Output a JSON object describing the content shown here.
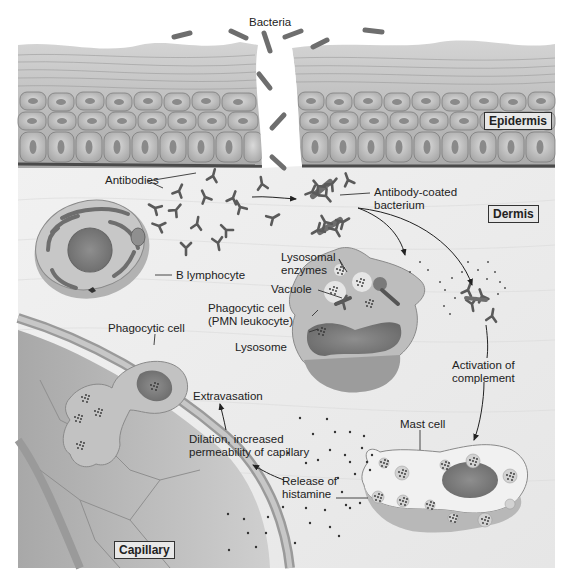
{
  "diagram": {
    "regions": {
      "epidermis": "Epidermis",
      "dermis": "Dermis",
      "capillary": "Capillary"
    },
    "labels": {
      "bacteria": "Bacteria",
      "antibodies": "Antibodies",
      "antibody_coated_1": "Antibody-coated",
      "antibody_coated_2": "bacterium",
      "b_lymphocyte": "B lymphocyte",
      "lysosomal_1": "Lysosomal",
      "lysosomal_2": "enzymes",
      "vacuole": "Vacuole",
      "phagocytic_pmn_1": "Phagocytic cell",
      "phagocytic_pmn_2": "(PMN leukocyte)",
      "lysosome": "Lysosome",
      "phagocytic_cell": "Phagocytic cell",
      "extravasation": "Extravasation",
      "dilation_1": "Dilation, increased",
      "dilation_2": "permeability of capillary",
      "activation_1": "Activation of",
      "activation_2": "complement",
      "mast_cell": "Mast cell",
      "release_1": "Release of",
      "release_2": "histamine"
    },
    "colors": {
      "background": "#ffffff",
      "dermis": "#ececec",
      "epidermis_cell": "#c9c9c9",
      "epidermis_nucleus": "#8a8a8a",
      "bacteria": "#6e6e6e",
      "antibody": "#5a5a5a",
      "cell_body": "#bdbdbd",
      "nucleus": "#7a7a7a",
      "capillary": "#b5b5b5",
      "text": "#222222"
    }
  }
}
